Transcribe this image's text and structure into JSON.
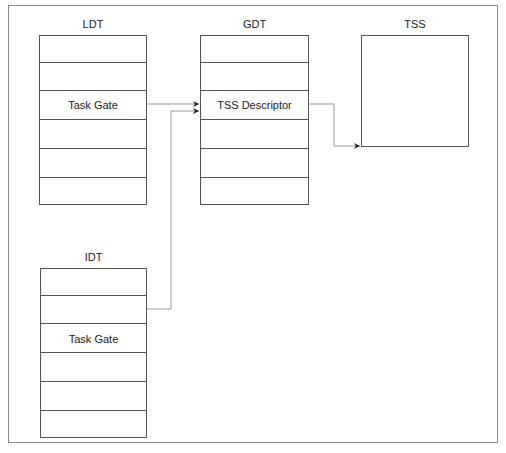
{
  "diagram": {
    "tables": [
      {
        "id": "ldt",
        "label": "LDT",
        "rows": [
          "",
          "",
          "Task Gate",
          "",
          "",
          ""
        ]
      },
      {
        "id": "gdt",
        "label": "GDT",
        "rows": [
          "",
          "",
          "TSS Descriptor",
          "",
          "",
          ""
        ]
      },
      {
        "id": "idt",
        "label": "IDT",
        "rows": [
          "",
          "",
          "Task Gate",
          "",
          "",
          ""
        ]
      }
    ],
    "tss": {
      "label": "TSS"
    },
    "connections": [
      {
        "from": "LDT.Task Gate",
        "to": "GDT.TSS Descriptor"
      },
      {
        "from": "IDT.Task Gate",
        "to": "GDT.TSS Descriptor"
      },
      {
        "from": "GDT.TSS Descriptor",
        "to": "TSS"
      }
    ],
    "colors": {
      "border": "#555555",
      "frame": "#8a8a8a",
      "connector": "#9a9a9a",
      "arrowhead": "#222222"
    }
  }
}
